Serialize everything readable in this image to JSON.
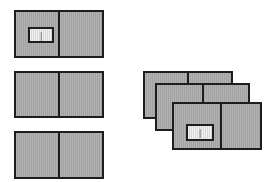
{
  "canvas": {
    "width": 279,
    "height": 182,
    "background_color": "#ffffff"
  },
  "style": {
    "card_fill": "#a9a9a9",
    "card_border": "#1d1d1d",
    "inner_box_fill": "#e3e3e3",
    "inner_box_border": "#1d1d1d",
    "divider_color": "#1d1d1d"
  },
  "groups": [
    {
      "name": "left-column",
      "cards": [
        {
          "id": "card-left-1",
          "divider_percent": 49,
          "inner_box": {
            "label": "|"
          }
        },
        {
          "id": "card-left-2",
          "divider_percent": 49,
          "inner_box": null
        },
        {
          "id": "card-left-3",
          "divider_percent": 49,
          "inner_box": null
        }
      ]
    },
    {
      "name": "right-stack",
      "cards": [
        {
          "id": "card-stack-back",
          "divider_percent": 49,
          "inner_box": null
        },
        {
          "id": "card-stack-middle",
          "divider_percent": 49,
          "inner_box": null
        },
        {
          "id": "card-stack-front",
          "divider_percent": 53,
          "inner_box": {
            "label": "|"
          }
        }
      ]
    }
  ],
  "labels": {
    "inner_box_left_1": "|",
    "inner_box_stack_front": "|"
  }
}
